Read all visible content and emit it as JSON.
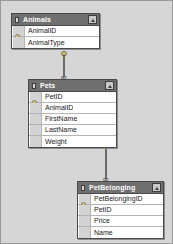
{
  "diagram": {
    "type": "database-relationship-diagram",
    "background_color": "#d6d6d6",
    "border_color": "#9a9a9a",
    "header_color": "#6f6f6f",
    "header_text_color": "#ffffff",
    "row_background": "#ffffff",
    "gutter_color": "#d3d3d3",
    "connector_color": "#6b6b6b",
    "key_icon_color": "#d8c14a"
  },
  "tables": [
    {
      "name": "Animals",
      "collapse_button": "collapse",
      "fields": [
        {
          "name": "AnimalID",
          "key": true,
          "icon": "key-icon"
        },
        {
          "name": "AnimalType",
          "key": false,
          "icon": ""
        }
      ]
    },
    {
      "name": "Pets",
      "collapse_button": "collapse",
      "fields": [
        {
          "name": "PetID",
          "key": true,
          "icon": "key-icon"
        },
        {
          "name": "AnimalID",
          "key": false,
          "icon": ""
        },
        {
          "name": "FirstName",
          "key": false,
          "icon": ""
        },
        {
          "name": "LastName",
          "key": false,
          "icon": ""
        },
        {
          "name": "Weight",
          "key": false,
          "icon": ""
        }
      ]
    },
    {
      "name": "PetBelonging",
      "collapse_button": "collapse",
      "fields": [
        {
          "name": "PetBelongingID",
          "key": true,
          "icon": "key-icon"
        },
        {
          "name": "PetID",
          "key": false,
          "icon": ""
        },
        {
          "name": "Price",
          "key": false,
          "icon": ""
        },
        {
          "name": "Name",
          "key": false,
          "icon": ""
        }
      ]
    }
  ],
  "relationships": [
    {
      "from_table": "Animals",
      "to_table": "Pets",
      "from_cardinality": "1",
      "to_cardinality": "many",
      "from_symbol": "key-icon",
      "to_symbol": "infinity-icon",
      "to_symbol_char": "∞"
    },
    {
      "from_table": "Pets",
      "to_table": "PetBelonging",
      "from_cardinality": "1",
      "to_cardinality": "many",
      "from_symbol": "key-icon",
      "to_symbol": "infinity-icon",
      "to_symbol_char": "∞"
    }
  ]
}
